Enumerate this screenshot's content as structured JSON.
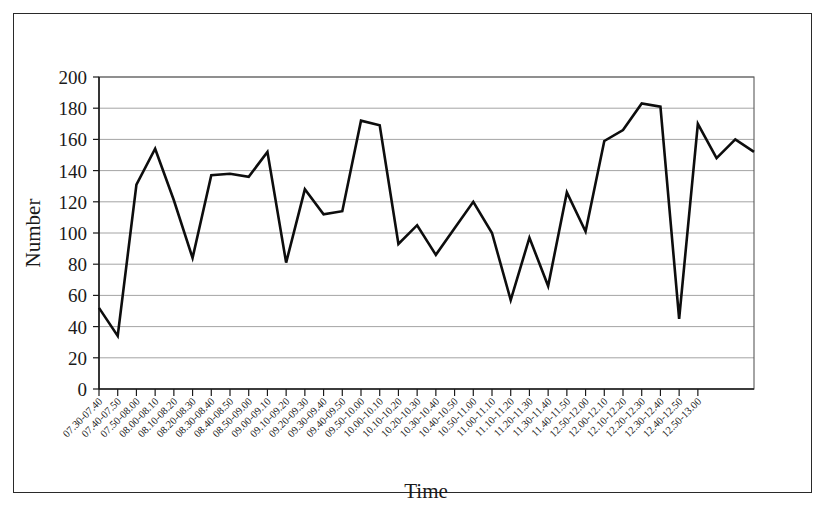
{
  "chart_data": {
    "type": "line",
    "title": "",
    "xlabel": "Time",
    "ylabel": "Number",
    "ylim": [
      0,
      200
    ],
    "ytick_step": 20,
    "yticks": [
      0,
      20,
      40,
      60,
      80,
      100,
      120,
      140,
      160,
      180,
      200
    ],
    "grid": true,
    "legend": "none",
    "line_color": "#0d0d0d",
    "categories": [
      "07.30-07.40",
      "07.40-07.50",
      "07.50-08.00",
      "08.00-08.10",
      "08.10-08.20",
      "08.20-08.30",
      "08.30-08.40",
      "08.40-08.50",
      "08.50-09.00",
      "09.00-09.10",
      "09.10-09.20",
      "09.20-09.30",
      "09.30-09.40",
      "09.40-09.50",
      "09.50-10.00",
      "10.00-10.10",
      "10.10-10.20",
      "10.20-10.30",
      "10.30-10.40",
      "10.40-10.50",
      "10.50-11.00",
      "11.00-11.10",
      "11.10-11.20",
      "11.20-11.30",
      "11.30-11.40",
      "11.40-11.50",
      "12.50-12.00",
      "12.00-12.10",
      "12.10-12.20",
      "12.20-12.30",
      "12.30-12.40",
      "12.40-12.50",
      "12.50-13.00"
    ],
    "values": [
      52,
      34,
      131,
      154,
      121,
      84,
      137,
      138,
      136,
      152,
      81,
      128,
      112,
      114,
      172,
      169,
      93,
      105,
      86,
      103,
      120,
      100,
      57,
      97,
      66,
      126,
      101,
      159,
      166,
      183,
      181,
      45,
      170
    ],
    "values_tail": [
      148,
      160,
      152
    ]
  }
}
